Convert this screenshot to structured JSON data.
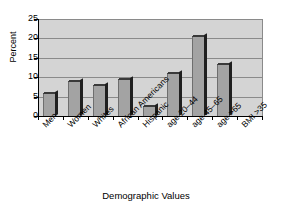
{
  "chart_data": {
    "type": "bar",
    "title": "",
    "xlabel": "Demographic Values",
    "ylabel": "Percent",
    "categories": [
      "Men",
      "Women",
      "Whites",
      "African Americans",
      "Hispanic",
      "age 20–44",
      "age 45–65",
      "age >65",
      "BMI >35"
    ],
    "values": [
      6,
      9,
      8,
      9.5,
      2.5,
      11,
      20.5,
      13.5,
      0
    ],
    "ylim": [
      0,
      25
    ],
    "ytick_labels": [
      "0",
      "5",
      "10",
      "15",
      "20",
      "25"
    ],
    "ytick_values": [
      0,
      5,
      10,
      15,
      20,
      25
    ],
    "grid": true,
    "legend": false,
    "bar_color": "#a3a3a3",
    "plot_background": "#d4d4d4",
    "axis_color": "#000000",
    "gridline_color": "#8a8a8a"
  }
}
